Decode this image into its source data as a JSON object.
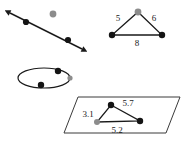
{
  "figure": {
    "background_color": "#ffffff",
    "stroke_color": "#1a1a1a",
    "point_black_color": "#141414",
    "point_gray_color": "#8c8c8c",
    "width": 182,
    "height": 142,
    "panels": [
      {
        "name": "line-with-points",
        "shape": "double-headed-line",
        "description": "Double headed arrow running from upper left to lower right with two black points on it and one isolated gray point above the line",
        "points": [
          {
            "kind": "black",
            "x": 26,
            "y": 22
          },
          {
            "kind": "black",
            "x": 68,
            "y": 40
          },
          {
            "kind": "gray",
            "x": 53,
            "y": 14
          }
        ],
        "arrow_start": {
          "x": 10,
          "y": 13
        },
        "arrow_end": {
          "x": 82,
          "y": 49
        }
      },
      {
        "name": "triangle-with-edge-lengths",
        "shape": "triangle",
        "description": "Triangle with gray apex point and two black base points, edges labelled with lengths",
        "vertices": [
          {
            "kind": "gray",
            "x": 138,
            "y": 12
          },
          {
            "kind": "black",
            "x": 112,
            "y": 35
          },
          {
            "kind": "black",
            "x": 162,
            "y": 35
          }
        ],
        "edge_labels": [
          {
            "text": "5",
            "x": 118,
            "y": 21
          },
          {
            "text": "6",
            "x": 154,
            "y": 21
          },
          {
            "text": "8",
            "x": 137,
            "y": 46
          }
        ]
      },
      {
        "name": "ellipse-with-points",
        "shape": "ellipse",
        "description": "Flat ellipse in perspective with two black points on its rim and a gray point at the right vertex",
        "center": {
          "x": 44,
          "y": 78
        },
        "radius_x": 26,
        "radius_y": 10,
        "points": [
          {
            "kind": "black",
            "x": 58,
            "y": 71
          },
          {
            "kind": "black",
            "x": 41,
            "y": 85
          },
          {
            "kind": "gray",
            "x": 70,
            "y": 78
          }
        ]
      },
      {
        "name": "parallelogram-plane-with-triangle",
        "shape": "parallelogram",
        "description": "Parallelogram representing a plane containing a triangle of three points with decimal edge lengths",
        "corners": [
          {
            "x": 78,
            "y": 97
          },
          {
            "x": 180,
            "y": 97
          },
          {
            "x": 166,
            "y": 133
          },
          {
            "x": 64,
            "y": 133
          }
        ],
        "vertices": [
          {
            "kind": "black",
            "x": 111,
            "y": 105
          },
          {
            "kind": "gray",
            "x": 97,
            "y": 122
          },
          {
            "kind": "black",
            "x": 140,
            "y": 121
          }
        ],
        "edge_labels": [
          {
            "text": "3.1",
            "x": 88,
            "y": 117
          },
          {
            "text": "5.7",
            "x": 128,
            "y": 106
          },
          {
            "text": "5.2",
            "x": 117,
            "y": 133
          }
        ]
      }
    ]
  }
}
